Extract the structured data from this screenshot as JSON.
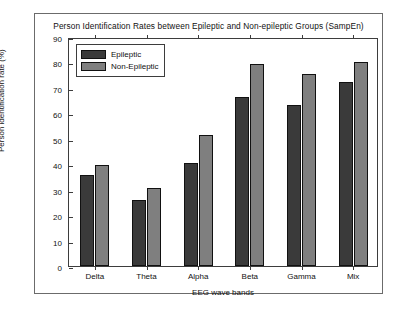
{
  "chart_data": {
    "type": "bar",
    "title": "Person Identification Rates between Epileptic and Non-epileptic Groups (SampEn)",
    "xlabel": "EEG wave bands",
    "ylabel": "Person identification rate (%)",
    "categories": [
      "Delta",
      "Theta",
      "Alpha",
      "Beta",
      "Gamma",
      "Mix"
    ],
    "series": [
      {
        "name": "Epileptic",
        "color": "#3a3a3a",
        "values": [
          36,
          26,
          41,
          67,
          64,
          73
        ]
      },
      {
        "name": "Non-Epileptic",
        "color": "#7f7f7f",
        "values": [
          40,
          31,
          52,
          80,
          76,
          81
        ]
      }
    ],
    "ylim": [
      0,
      90
    ],
    "yticks": [
      0,
      10,
      20,
      30,
      40,
      50,
      60,
      70,
      80,
      90
    ],
    "ytick_labels": [
      "0",
      "10",
      "20",
      "30",
      "40",
      "50",
      "60",
      "70",
      "80",
      "90"
    ],
    "grid": false,
    "legend_position": "top-left"
  }
}
